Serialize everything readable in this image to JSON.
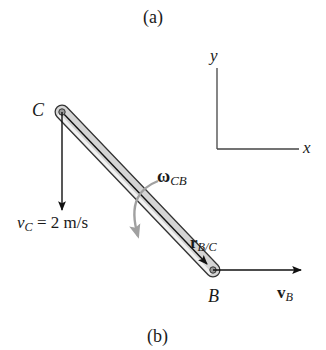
{
  "caption_top": "(a)",
  "caption_bottom": "(b)",
  "axes": {
    "x_label": "x",
    "y_label": "y"
  },
  "points": {
    "C": "C",
    "B": "B"
  },
  "velocity_C": {
    "symbol": "v",
    "subscript": "C",
    "value": "= 2 m/s"
  },
  "velocity_B": {
    "symbol": "v",
    "subscript": "B"
  },
  "angular_velocity": {
    "symbol": "ω",
    "subscript": "CB"
  },
  "position_vector": {
    "symbol": "r",
    "subscript": "B/C"
  },
  "colors": {
    "rod_fill": "#c8c8c8",
    "rod_edge": "#333333",
    "omega_arrow": "#a0a0a0",
    "ink": "#1a1a1a"
  }
}
